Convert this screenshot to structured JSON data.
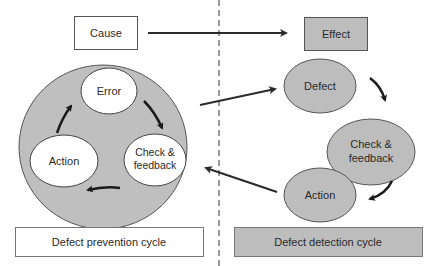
{
  "diagram": {
    "top_left_box": {
      "label": "Cause",
      "fill": "#ffffff"
    },
    "top_right_box": {
      "label": "Effect",
      "fill": "#bdbdbd"
    },
    "prevention": {
      "cycle_fill": "#bfbfbf",
      "nodes": [
        {
          "id": "error",
          "label": "Error"
        },
        {
          "id": "check-feedback",
          "label_line1": "Check &",
          "label_line2": "feedback"
        },
        {
          "id": "action",
          "label": "Action"
        }
      ],
      "caption": "Defect prevention cycle",
      "caption_fill": "#ffffff"
    },
    "detection": {
      "node_fill": "#bdbdbd",
      "nodes": [
        {
          "id": "defect",
          "label": "Defect"
        },
        {
          "id": "check-feedback",
          "label_line1": "Check &",
          "label_line2": "feedback"
        },
        {
          "id": "action",
          "label": "Action"
        }
      ],
      "caption": "Defect detection cycle",
      "caption_fill": "#bdbdbd"
    },
    "edges": [
      {
        "from": "Cause",
        "to": "Effect"
      },
      {
        "from": "Defect prevention cycle",
        "to": "Defect"
      },
      {
        "from": "Action (detection)",
        "to": "Defect prevention cycle"
      },
      {
        "from": "Error",
        "to": "Check & feedback (prevention)"
      },
      {
        "from": "Check & feedback (prevention)",
        "to": "Action (prevention)"
      },
      {
        "from": "Action (prevention)",
        "to": "Error"
      },
      {
        "from": "Defect",
        "to": "Check & feedback (detection)"
      },
      {
        "from": "Check & feedback (detection)",
        "to": "Action (detection)"
      }
    ],
    "divider": "dashed vertical line"
  }
}
